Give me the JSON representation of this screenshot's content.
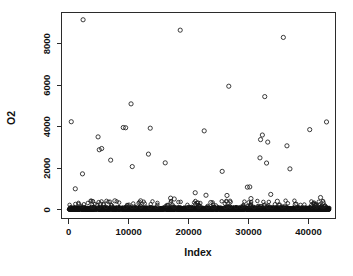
{
  "chart_data": {
    "type": "scatter",
    "title": "",
    "xlabel": "Index",
    "ylabel": "O2",
    "xlim": [
      -1200,
      44500
    ],
    "ylim": [
      -420,
      9500
    ],
    "grid": false,
    "legend": null,
    "point_symbol": "open-circle",
    "point_color": "#1a1a1a",
    "xticks": [
      0,
      10000,
      20000,
      30000,
      40000
    ],
    "xtick_labels": [
      "0",
      "10000",
      "20000",
      "30000",
      "40000"
    ],
    "yticks": [
      0,
      2000,
      4000,
      6000,
      8000
    ],
    "ytick_labels": [
      "0",
      "2000",
      "4000",
      "6000",
      "8000"
    ],
    "outliers": {
      "x": [
        2400,
        18600,
        35800,
        26700,
        32700,
        10400,
        9100,
        430,
        43000,
        9500,
        13600,
        22600,
        40200,
        4900,
        5500,
        5100,
        32000,
        32300,
        33200,
        36400,
        31900,
        7000,
        13300,
        30200,
        16100,
        33000,
        10600,
        36900,
        2300,
        25600,
        29800,
        21100,
        22900,
        26400,
        33700,
        7700,
        12000,
        17000,
        17600,
        21400,
        23700,
        30400,
        34800,
        37800,
        42000,
        1100
      ],
      "y": [
        9150,
        8650,
        8300,
        5950,
        5450,
        5100,
        3960,
        4240,
        4230,
        3950,
        3930,
        3800,
        3860,
        3510,
        2950,
        2890,
        3380,
        3600,
        3260,
        3080,
        2500,
        2390,
        2680,
        1100,
        2260,
        2250,
        2080,
        1970,
        1730,
        1850,
        1090,
        820,
        700,
        690,
        740,
        430,
        430,
        560,
        520,
        320,
        350,
        540,
        410,
        260,
        590,
        1010
      ]
    },
    "dense_band": {
      "description": "dense overplotted mass of points near y=0 spanning the full index range",
      "n_points_approx": 43000,
      "x_range": [
        0,
        43500
      ],
      "y_range": [
        0,
        120
      ]
    },
    "n_observations_approx": 43000
  },
  "axes": {
    "y_title": "O2",
    "x_title": "Index"
  }
}
